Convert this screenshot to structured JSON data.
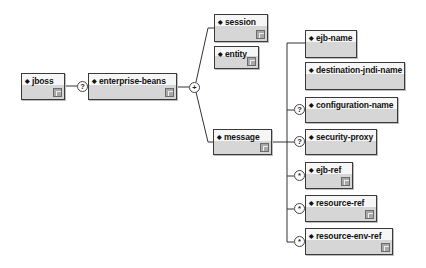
{
  "diagram": {
    "root": {
      "label": "jboss"
    },
    "root_child_connector": "?",
    "enterprise_beans": {
      "label": "enterprise-beans"
    },
    "eb_connector": "+",
    "eb_children": [
      {
        "label": "session"
      },
      {
        "label": "entity"
      },
      {
        "label": "message"
      }
    ],
    "message_children": [
      {
        "label": "ejb-name",
        "occurrence": ""
      },
      {
        "label": "destination-jndi-name",
        "occurrence": ""
      },
      {
        "label": "configuration-name",
        "occurrence": "?"
      },
      {
        "label": "security-proxy",
        "occurrence": "?"
      },
      {
        "label": "ejb-ref",
        "occurrence": "*"
      },
      {
        "label": "resource-ref",
        "occurrence": "*"
      },
      {
        "label": "resource-env-ref",
        "occurrence": "*"
      }
    ]
  },
  "colors": {
    "border": "#3a3a3a",
    "box_top": "#f6f6f6",
    "box_bottom": "#d6d6d6",
    "ref_icon": "#a8a8a8"
  }
}
